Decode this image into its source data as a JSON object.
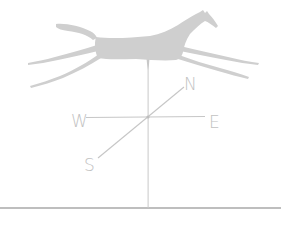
{
  "illustration": {
    "subject": "horse weathervane",
    "colors": {
      "background": "#ffffff",
      "silhouette": "#cfcfcf",
      "lines": "#c6c6c6",
      "labels": "#c2c2c2",
      "ground": "#a8a8a8"
    },
    "compass": {
      "north": "N",
      "east": "E",
      "south": "S",
      "west": "W"
    }
  }
}
